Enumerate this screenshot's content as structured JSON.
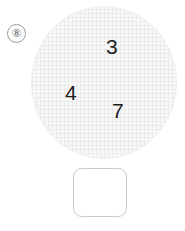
{
  "exercise": {
    "number_label": "⑧",
    "number_value": "8",
    "field": {
      "shape": "circle",
      "fill_color": "#f8f8f8",
      "border_color": "#eeeeee",
      "items": [
        {
          "label": "3"
        },
        {
          "label": "4"
        },
        {
          "label": "7"
        }
      ]
    },
    "answer": {
      "value": "",
      "placeholder": "",
      "border_color": "#c9c9c9",
      "fill_color": "#ffffff"
    }
  }
}
